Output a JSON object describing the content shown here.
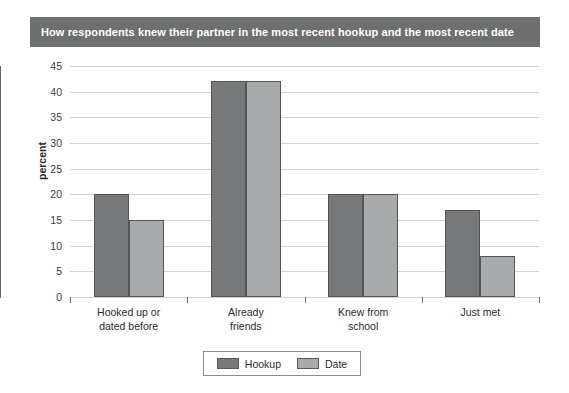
{
  "chart_data": {
    "type": "bar",
    "title": "How respondents knew their partner in the most recent hookup and the most recent date",
    "xlabel": "",
    "ylabel": "percent",
    "ylim": [
      0,
      45
    ],
    "ytick_step": 5,
    "yticks": [
      45,
      40,
      35,
      30,
      25,
      20,
      15,
      10,
      5,
      0
    ],
    "grid": true,
    "grid_axis": "y",
    "legend_position": "bottom-center",
    "categories": [
      "Hooked up or dated before",
      "Already friends",
      "Knew from school",
      "Just met"
    ],
    "category_lines": [
      [
        "Hooked up or",
        "dated before"
      ],
      [
        "Already",
        "friends"
      ],
      [
        "Knew from",
        "school"
      ],
      [
        "Just met",
        ""
      ]
    ],
    "series": [
      {
        "name": "Hookup",
        "color": "#77787a",
        "values": [
          20,
          42,
          20,
          17
        ]
      },
      {
        "name": "Date",
        "color": "#a9aaac",
        "values": [
          15,
          42,
          20,
          8
        ]
      }
    ]
  },
  "banner": {
    "color": "#6e6f71",
    "text_color": "#ffffff"
  },
  "legend": {
    "entries": [
      {
        "label": "Hookup",
        "color": "#77787a"
      },
      {
        "label": "Date",
        "color": "#a9aaac"
      }
    ]
  }
}
